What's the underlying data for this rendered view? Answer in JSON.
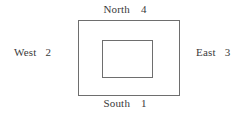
{
  "figure": {
    "type": "nested-rectangles-compass-diagram",
    "labels": {
      "north": {
        "name": "North",
        "value": "4"
      },
      "south": {
        "name": "South",
        "value": "1"
      },
      "west": {
        "name": "West",
        "value": "2"
      },
      "east": {
        "name": "East",
        "value": "3"
      }
    },
    "colors": {
      "stroke": "#6e6e6e",
      "background": "#ffffff",
      "text": "#3a3a3a"
    }
  }
}
